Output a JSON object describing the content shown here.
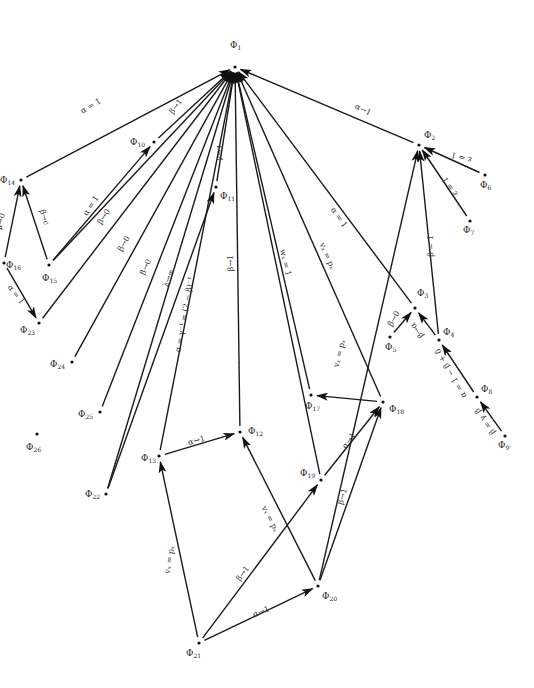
{
  "diagram": {
    "title": "",
    "nodes": [
      {
        "id": "Phi1",
        "name": "Φ",
        "sub": "1",
        "x": 235,
        "y": 67,
        "lx": 230,
        "ly": 48
      },
      {
        "id": "Phi2",
        "name": "Φ",
        "sub": "2",
        "x": 419,
        "y": 145,
        "lx": 424,
        "ly": 138
      },
      {
        "id": "Phi3",
        "name": "Φ",
        "sub": "3",
        "x": 415,
        "y": 308,
        "lx": 417,
        "ly": 296
      },
      {
        "id": "Phi4",
        "name": "Φ",
        "sub": "4",
        "x": 439,
        "y": 340,
        "lx": 443,
        "ly": 335
      },
      {
        "id": "Phi5",
        "name": "Φ",
        "sub": "5",
        "x": 390,
        "y": 337,
        "lx": 385,
        "ly": 350
      },
      {
        "id": "Phi6",
        "name": "Φ",
        "sub": "6",
        "x": 485,
        "y": 175,
        "lx": 480,
        "ly": 188
      },
      {
        "id": "Phi7",
        "name": "Φ",
        "sub": "7",
        "x": 470,
        "y": 221,
        "lx": 463,
        "ly": 233
      },
      {
        "id": "Phi8",
        "name": "Φ",
        "sub": "8",
        "x": 477,
        "y": 397,
        "lx": 481,
        "ly": 392
      },
      {
        "id": "Phi9p",
        "name": "Φ",
        "sub": "9'",
        "x": 505,
        "y": 436,
        "lx": 498,
        "ly": 448
      },
      {
        "id": "Phi10",
        "name": "Φ",
        "sub": "10",
        "x": 154,
        "y": 142,
        "lx": 130,
        "ly": 145
      },
      {
        "id": "Phi11",
        "name": "Φ",
        "sub": "11",
        "x": 216,
        "y": 187,
        "lx": 220,
        "ly": 199
      },
      {
        "id": "Phi12",
        "name": "Φ",
        "sub": "12",
        "x": 240,
        "y": 432,
        "lx": 248,
        "ly": 434
      },
      {
        "id": "Phi13",
        "name": "Φ",
        "sub": "13",
        "x": 159,
        "y": 456,
        "lx": 141,
        "ly": 461
      },
      {
        "id": "Phi14",
        "name": "Φ",
        "sub": "14",
        "x": 21,
        "y": 180,
        "lx": 0,
        "ly": 183
      },
      {
        "id": "Phi15",
        "name": "Φ",
        "sub": "15",
        "x": 49,
        "y": 265,
        "lx": 42,
        "ly": 281
      },
      {
        "id": "Phi16",
        "name": "Φ",
        "sub": "16",
        "x": 4,
        "y": 263,
        "lx": 6,
        "ly": 268
      },
      {
        "id": "Phi17",
        "name": "Φ",
        "sub": "17",
        "x": 311,
        "y": 395,
        "lx": 305,
        "ly": 409
      },
      {
        "id": "Phi18",
        "name": "Φ",
        "sub": "18",
        "x": 383,
        "y": 402,
        "lx": 389,
        "ly": 412
      },
      {
        "id": "Phi19",
        "name": "Φ",
        "sub": "19",
        "x": 321,
        "y": 480,
        "lx": 300,
        "ly": 476
      },
      {
        "id": "Phi20",
        "name": "Φ",
        "sub": "20",
        "x": 318,
        "y": 586,
        "lx": 322,
        "ly": 599
      },
      {
        "id": "Phi21",
        "name": "Φ",
        "sub": "21",
        "x": 199,
        "y": 643,
        "lx": 186,
        "ly": 656
      },
      {
        "id": "Phi22",
        "name": "Φ",
        "sub": "22",
        "x": 106,
        "y": 494,
        "lx": 85,
        "ly": 497
      },
      {
        "id": "Phi23",
        "name": "Φ",
        "sub": "23",
        "x": 39,
        "y": 323,
        "lx": 20,
        "ly": 333
      },
      {
        "id": "Phi24",
        "name": "Φ",
        "sub": "24",
        "x": 72,
        "y": 362,
        "lx": 50,
        "ly": 367
      },
      {
        "id": "Phi25",
        "name": "Φ",
        "sub": "25",
        "x": 100,
        "y": 412,
        "lx": 78,
        "ly": 417
      },
      {
        "id": "Phi26",
        "name": "Φ",
        "sub": "26",
        "x": 37,
        "y": 434,
        "lx": 26,
        "ly": 450
      }
    ],
    "edges": [
      {
        "from": "Phi14",
        "to": "Phi1",
        "label": "α = 1",
        "lx": 92,
        "ly": 108,
        "rot": -31
      },
      {
        "from": "Phi10",
        "to": "Phi1",
        "label": "β→1",
        "lx": 178,
        "ly": 108,
        "rot": -53
      },
      {
        "from": "Phi15",
        "to": "Phi1",
        "label": "β→0",
        "lx": 106,
        "ly": 218,
        "rot": -57
      },
      {
        "from": "Phi23",
        "to": "Phi1",
        "label": "β→0",
        "lx": 126,
        "ly": 245,
        "rot": -60
      },
      {
        "from": "Phi24",
        "to": "Phi1",
        "label": "β→0",
        "lx": 148,
        "ly": 268,
        "rot": -64
      },
      {
        "from": "Phi25",
        "to": "Phi1",
        "label": "λ→∞",
        "lx": 171,
        "ly": 279,
        "rot": -70
      },
      {
        "from": "Phi22",
        "to": "Phi1",
        "label": "",
        "lx": 0,
        "ly": 0,
        "rot": 0
      },
      {
        "from": "Phi11",
        "to": "Phi1",
        "label": "γ→1",
        "lx": 222,
        "ly": 153,
        "rot": -83
      },
      {
        "from": "Phi13",
        "to": "Phi1",
        "label": "",
        "lx": 0,
        "ly": 0,
        "rot": 0
      },
      {
        "from": "Phi12",
        "to": "Phi1",
        "label": "β→1",
        "lx": 233,
        "ly": 263,
        "rot": -90
      },
      {
        "from": "Phi17",
        "to": "Phi1",
        "label": "wₓ = 1",
        "lx": 283,
        "ly": 263,
        "rot": 77
      },
      {
        "from": "Phi18",
        "to": "Phi1",
        "label": "vₓ = pₓ",
        "lx": 325,
        "ly": 257,
        "rot": 67
      },
      {
        "from": "Phi19",
        "to": "Phi1",
        "label": "",
        "lx": 0,
        "ly": 0,
        "rot": 0
      },
      {
        "from": "Phi3",
        "to": "Phi1",
        "label": "α = 1",
        "lx": 337,
        "ly": 219,
        "rot": 55
      },
      {
        "from": "Phi2",
        "to": "Phi1",
        "label": "α→1",
        "lx": 362,
        "ly": 112,
        "rot": 27
      },
      {
        "from": "Phi6",
        "to": "Phi2",
        "label": "ε = 1",
        "lx": 462,
        "ly": 155,
        "rot": 195
      },
      {
        "from": "Phi7",
        "to": "Phi2",
        "label": "ε = 1",
        "lx": 452,
        "ly": 185,
        "rot": 236
      },
      {
        "from": "Phi4",
        "to": "Phi2",
        "label": "β = 1",
        "lx": 433,
        "ly": 246,
        "rot": 270
      },
      {
        "from": "Phi20",
        "to": "Phi2",
        "label": "vₓ = pₓ",
        "lx": 342,
        "ly": 354,
        "rot": -76
      },
      {
        "from": "Phi5",
        "to": "Phi3",
        "label": "β→0",
        "lx": 396,
        "ly": 320,
        "rot": -60
      },
      {
        "from": "Phi4",
        "to": "Phi3",
        "label": "β→α",
        "lx": 419,
        "ly": 329,
        "rot": 235
      },
      {
        "from": "Phi8",
        "to": "Phi4",
        "label": "α = 1 − β + δ",
        "lx": 453,
        "ly": 372,
        "rot": 240
      },
      {
        "from": "Phi9p",
        "to": "Phi8",
        "label": "β = γ_β",
        "lx": 487,
        "ly": 420,
        "rot": 235
      },
      {
        "from": "Phi18",
        "to": "Phi17",
        "label": "",
        "lx": 0,
        "ly": 0,
        "rot": 0
      },
      {
        "from": "Phi19",
        "to": "Phi18",
        "label": "α→1",
        "lx": 351,
        "ly": 442,
        "rot": -55
      },
      {
        "from": "Phi20",
        "to": "Phi18",
        "label": "β→1",
        "lx": 345,
        "ly": 497,
        "rot": -75
      },
      {
        "from": "Phi13",
        "to": "Phi12",
        "label": "α→1",
        "lx": 197,
        "ly": 443,
        "rot": -15
      },
      {
        "from": "Phi20",
        "to": "Phi12",
        "label": "vₓ = pₓ",
        "lx": 268,
        "ly": 520,
        "rot": 63
      },
      {
        "from": "Phi21",
        "to": "Phi13",
        "label": "vₓ = pₓ",
        "lx": 172,
        "ly": 560,
        "rot": -80
      },
      {
        "from": "Phi21",
        "to": "Phi19",
        "label": "β→1",
        "lx": 245,
        "ly": 575,
        "rot": -53
      },
      {
        "from": "Phi21",
        "to": "Phi20",
        "label": "α→1",
        "lx": 262,
        "ly": 614,
        "rot": -22
      },
      {
        "from": "Phi15",
        "to": "Phi10",
        "label": "α = 1",
        "lx": 93,
        "ly": 207,
        "rot": -57
      },
      {
        "from": "Phi16",
        "to": "Phi14",
        "label": "μ→0",
        "lx": 3,
        "ly": 222,
        "rot": -77
      },
      {
        "from": "Phi15",
        "to": "Phi14",
        "label": "β→c",
        "lx": 42,
        "ly": 218,
        "rot": 74
      },
      {
        "from": "Phi16",
        "to": "Phi23",
        "label": "α = 1",
        "lx": 14,
        "ly": 296,
        "rot": 52
      },
      {
        "from": "Phi22",
        "to": "Phi11",
        "label": "α = γ⁻¹ = (2 − β)⁻¹",
        "lx": 187,
        "ly": 315,
        "rot": -80
      }
    ]
  }
}
